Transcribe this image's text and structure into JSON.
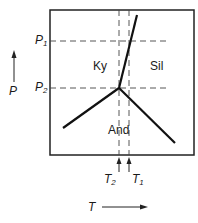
{
  "diagram": {
    "type": "phase-diagram",
    "axes": {
      "y_label": "P",
      "x_label": "T"
    },
    "pressure_markers": [
      {
        "symbol": "P",
        "subscript": "1"
      },
      {
        "symbol": "P",
        "subscript": "2"
      }
    ],
    "temperature_markers": [
      {
        "symbol": "T",
        "subscript": "2"
      },
      {
        "symbol": "T",
        "subscript": "1"
      }
    ],
    "fields": {
      "kyanite": "Ky",
      "sillimanite": "Sil",
      "andalusite": "And"
    },
    "colors": {
      "line": "#111111",
      "dash": "#333333"
    }
  }
}
